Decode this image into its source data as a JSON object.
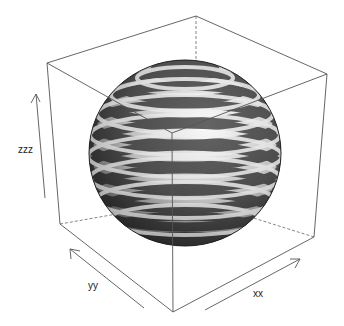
{
  "plot": {
    "type": "3d-surface",
    "object": "sphere with spiral bands",
    "axes": {
      "x": {
        "label": "xx"
      },
      "y": {
        "label": "yy"
      },
      "z": {
        "label": "zzz"
      }
    },
    "colors": {
      "background": "#ffffff",
      "box": "#555555",
      "band_dark": "#111111",
      "band_light": "#f4f4f4"
    }
  }
}
